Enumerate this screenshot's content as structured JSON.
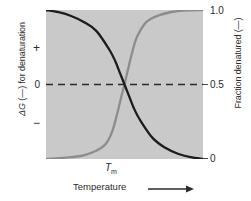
{
  "chart_data": {
    "type": "line",
    "title": "",
    "subtitle": "",
    "xlabel": "Temperature",
    "xlabel_arrow": "arrow-right",
    "x_annotation": "Tm",
    "x_annotation_base": "T",
    "x_annotation_sub": "m",
    "ylabel_left": "ΔG (—) for denaturation",
    "ylabel_left_parts": {
      "symbol": "ΔG",
      "dash": "(—)",
      "rest": "for denaturation"
    },
    "ylabel_right": "Fraction denatured (—)",
    "yticks_left": [
      "+",
      "0",
      "−"
    ],
    "yticks_right": [
      "1.0",
      "0.5",
      "0"
    ],
    "ylim_right": [
      0,
      1
    ],
    "grid": false,
    "legend": "none",
    "plot_background": "#c9c9c9",
    "midline_style": "dashed",
    "midline_value": 0.5,
    "series": [
      {
        "name": "ΔG for denaturation",
        "color": "#1c1c1c",
        "axis": "left",
        "shape": "sigmoid-decreasing",
        "x": [
          0.0,
          0.08,
          0.16,
          0.24,
          0.32,
          0.4,
          0.44,
          0.47,
          0.5,
          0.53,
          0.56,
          0.6,
          0.68,
          0.76,
          0.84,
          0.92,
          1.0
        ],
        "y": [
          1.0,
          0.985,
          0.96,
          0.92,
          0.86,
          0.74,
          0.66,
          0.58,
          0.5,
          0.42,
          0.34,
          0.26,
          0.14,
          0.075,
          0.035,
          0.012,
          0.0
        ]
      },
      {
        "name": "Fraction denatured",
        "color": "#8c8c8c",
        "axis": "right",
        "shape": "sigmoid-increasing",
        "x": [
          0.0,
          0.08,
          0.16,
          0.24,
          0.32,
          0.38,
          0.42,
          0.45,
          0.48,
          0.5,
          0.52,
          0.55,
          0.58,
          0.64,
          0.72,
          0.82,
          0.92,
          1.0
        ],
        "y": [
          0.0,
          0.005,
          0.012,
          0.025,
          0.055,
          0.1,
          0.18,
          0.29,
          0.42,
          0.5,
          0.59,
          0.72,
          0.82,
          0.92,
          0.965,
          0.99,
          0.998,
          1.0
        ]
      }
    ]
  },
  "axes": {
    "left": {
      "title": "ΔG (—) for denaturation",
      "tick_plus": "+",
      "tick_zero": "0",
      "tick_minus": "−"
    },
    "right": {
      "title": "Fraction denatured (—)",
      "tick_top": "1.0",
      "tick_mid": "0.5",
      "tick_bottom": "0"
    },
    "bottom": {
      "title": "Temperature",
      "tm_base": "T",
      "tm_sub": "m"
    }
  },
  "colors": {
    "plot_background": "#c9c9c9",
    "curve_dg": "#1c1c1c",
    "curve_fraction": "#8c8c8c",
    "text": "#2b2b2b",
    "axis_line": "#4a4a4a"
  }
}
